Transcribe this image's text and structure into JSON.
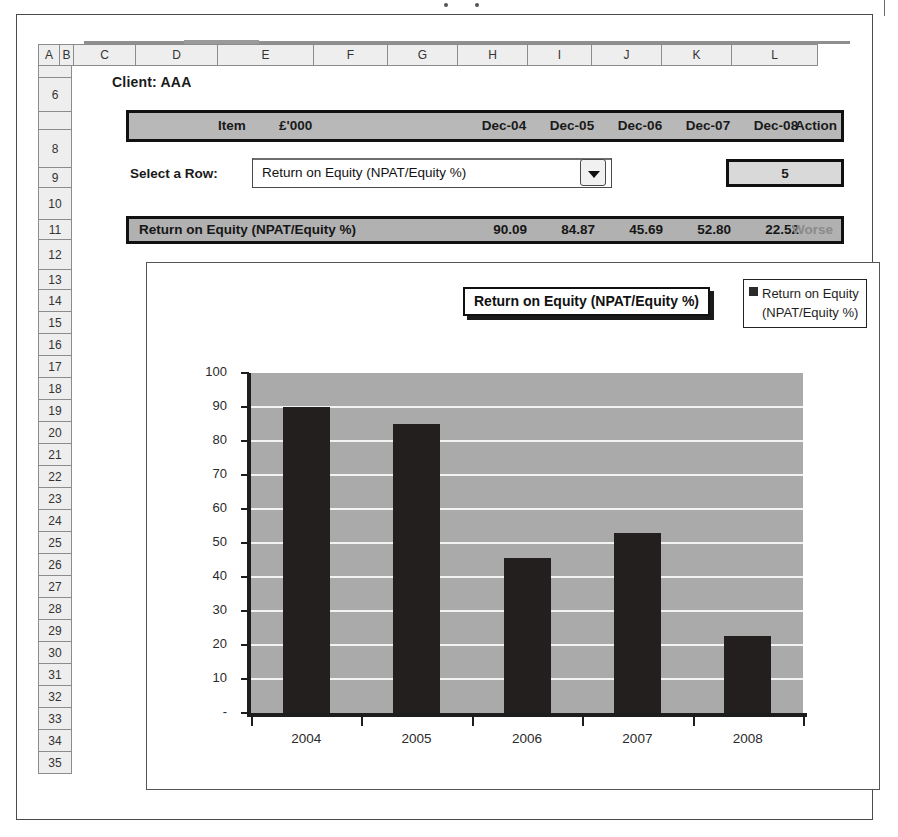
{
  "spreadsheet": {
    "column_headers": [
      "A",
      "B",
      "C",
      "D",
      "E",
      "F",
      "G",
      "H",
      "I",
      "J",
      "K",
      "L"
    ],
    "row_headers": [
      "",
      "6",
      "",
      "8",
      "9",
      "10",
      "11",
      "12",
      "13",
      "14",
      "15",
      "16",
      "17",
      "18",
      "19",
      "20",
      "21",
      "22",
      "23",
      "24",
      "25",
      "26",
      "27",
      "28",
      "29",
      "30",
      "31",
      "32",
      "33",
      "34",
      "35"
    ],
    "client_label": "Client: AAA"
  },
  "header_band": {
    "item": "Item",
    "units": "£'000",
    "periods": [
      "Dec-04",
      "Dec-05",
      "Dec-06",
      "Dec-07",
      "Dec-08"
    ],
    "action": "Action"
  },
  "selector": {
    "label": "Select a Row:",
    "value": "Return on Equity (NPAT/Equity %)",
    "placeholder": "Select a Row",
    "dropdown_icon": "chevron-down-icon",
    "count": "5"
  },
  "data_row": {
    "item": "Return on Equity (NPAT/Equity %)",
    "values": [
      "90.09",
      "84.87",
      "45.69",
      "52.80",
      "22.52"
    ],
    "action": "Worse"
  },
  "chart_data": {
    "type": "bar",
    "title": "Return on Equity (NPAT/Equity %)",
    "categories": [
      "2004",
      "2005",
      "2006",
      "2007",
      "2008"
    ],
    "series": [
      {
        "name": "Return on Equity (NPAT/Equity %)",
        "values": [
          90.09,
          84.87,
          45.69,
          52.8,
          22.52
        ]
      }
    ],
    "legend_entry_line1": "Return on Equity",
    "legend_entry_line2": "(NPAT/Equity %)",
    "legend_position": "top-right",
    "xlabel": "",
    "ylabel": "",
    "ylim": [
      0,
      100
    ],
    "ytick_labels": [
      "100",
      "90",
      "80",
      "70",
      "60",
      "50",
      "40",
      "30",
      "20",
      "10",
      "-"
    ],
    "ytick_values": [
      100,
      90,
      80,
      70,
      60,
      50,
      40,
      30,
      20,
      10,
      0
    ],
    "grid": true,
    "grid_color": "#f3f3f3",
    "plot_background": "#aaaaaa",
    "bar_color": "#231f1f"
  }
}
